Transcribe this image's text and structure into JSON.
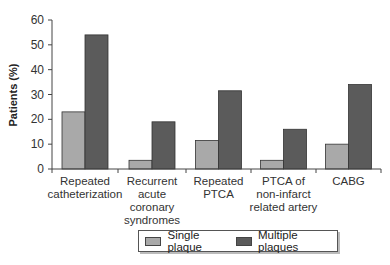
{
  "chart_data": {
    "type": "bar",
    "title": "",
    "xlabel": "",
    "ylabel": "Patients (%)",
    "ylim": [
      0,
      60
    ],
    "yticks": [
      0,
      10,
      20,
      30,
      40,
      50,
      60
    ],
    "grid": false,
    "legend_position": "bottom",
    "categories": [
      "Repeated catheterization",
      "Recurrent acute coronary syndromes",
      "Repeated PTCA",
      "PTCA of non-infarct related artery",
      "CABG"
    ],
    "category_lines": [
      [
        "Repeated",
        "catheterization"
      ],
      [
        "Recurrent",
        "acute",
        "coronary",
        "syndromes"
      ],
      [
        "Repeated",
        "PTCA"
      ],
      [
        "PTCA of",
        "non-infarct",
        "related artery"
      ],
      [
        "CABG"
      ]
    ],
    "series": [
      {
        "name": "Single plaque",
        "color": "#a9a9a9",
        "values": [
          23,
          3.5,
          11.5,
          3.5,
          10
        ]
      },
      {
        "name": "Multiple plaques",
        "color": "#5b5b5b",
        "values": [
          54,
          19,
          31.5,
          16,
          34
        ]
      }
    ]
  },
  "legend": {
    "items": [
      {
        "label": "Single plaque",
        "color": "#a9a9a9"
      },
      {
        "label": "Multiple plaques",
        "color": "#5b5b5b"
      }
    ]
  }
}
